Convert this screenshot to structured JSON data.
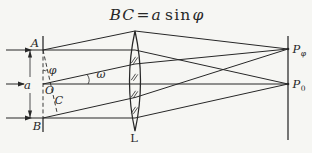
{
  "formula": {
    "lhs": "BC",
    "equals": "=",
    "coef": "a",
    "func": "sin",
    "angle": "φ"
  },
  "labels": {
    "point_top": "A",
    "point_bottom": "B",
    "slit_center": "O",
    "foot_point": "C",
    "slit_width": "a",
    "angle_phi": "φ",
    "angle_omega": "ω",
    "lens": "L"
  },
  "screen_points": {
    "upper": {
      "base": "P",
      "sub": "φ"
    },
    "lower": {
      "base": "P",
      "sub": "0"
    }
  },
  "colors": {
    "ink": "#272727",
    "paper": "#f6f6f3"
  }
}
